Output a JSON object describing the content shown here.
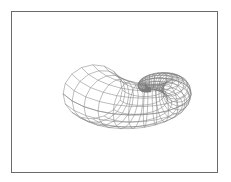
{
  "figure": {
    "type": "wireframe-seashell-surface",
    "frame": {
      "x": 11,
      "y": 11,
      "width": 205,
      "height": 160,
      "border_color": "#6a6a6a"
    },
    "line_color": "#7a7a7a",
    "background": "#ffffff",
    "shell": {
      "center": [
        150,
        88
      ],
      "turns": 1.25,
      "u_steps": 36,
      "v_steps": 16,
      "max_radius": 58,
      "max_tube": 30,
      "growth": 1.9,
      "tilt": 0.42
    }
  }
}
